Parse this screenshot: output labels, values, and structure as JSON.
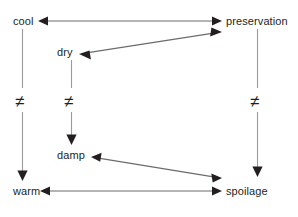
{
  "diagram": {
    "background_color": "#ffffff",
    "line_color": "#5a5a5a",
    "arrowhead_color": "#231f20",
    "text_color": "#231f20",
    "nodes": [
      {
        "id": "cool",
        "label": "cool",
        "x": 13,
        "y": 15
      },
      {
        "id": "preservation",
        "label": "preservation",
        "x": 226,
        "y": 15
      },
      {
        "id": "dry",
        "label": "dry",
        "x": 57,
        "y": 46
      },
      {
        "id": "damp",
        "label": "damp",
        "x": 57,
        "y": 149
      },
      {
        "id": "warm",
        "label": "warm",
        "x": 13,
        "y": 185
      },
      {
        "id": "spoilage",
        "label": "spoilage",
        "x": 226,
        "y": 185
      }
    ],
    "opposition_markers": [
      {
        "id": "cool-warm",
        "symbol": "≠",
        "x": 15,
        "y": 93
      },
      {
        "id": "dry-damp",
        "symbol": "≠",
        "x": 64,
        "y": 93
      },
      {
        "id": "preservation-spoilage",
        "symbol": "≠",
        "x": 250,
        "y": 93
      }
    ],
    "edges": [
      {
        "id": "cool-preservation",
        "from": "cool",
        "to": "preservation",
        "direction": "both",
        "style": "horizontal"
      },
      {
        "id": "dry-preservation",
        "from": "dry",
        "to": "preservation",
        "direction": "both",
        "style": "diagonal"
      },
      {
        "id": "cool-warm",
        "from": "cool",
        "to": "warm",
        "direction": "down",
        "style": "vertical"
      },
      {
        "id": "dry-damp",
        "from": "dry",
        "to": "damp",
        "direction": "down",
        "style": "vertical"
      },
      {
        "id": "preservation-spoilage",
        "from": "preservation",
        "to": "spoilage",
        "direction": "down",
        "style": "vertical"
      },
      {
        "id": "damp-spoilage",
        "from": "damp",
        "to": "spoilage",
        "direction": "both",
        "style": "diagonal"
      },
      {
        "id": "warm-spoilage",
        "from": "warm",
        "to": "spoilage",
        "direction": "both",
        "style": "horizontal"
      }
    ]
  }
}
